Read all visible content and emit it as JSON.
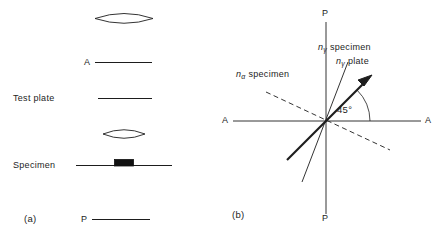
{
  "figure": {
    "background_color": "#ffffff",
    "stroke_color": "#1d1d1d",
    "width": 440,
    "height": 238
  },
  "panel_a": {
    "tag": "(a)",
    "labels": {
      "analyzer": "A",
      "test_plate": "Test plate",
      "specimen": "Specimen",
      "polarizer": "P"
    },
    "elements": [
      {
        "name": "top-lens",
        "kind": "lens"
      },
      {
        "name": "analyzer-line",
        "kind": "line"
      },
      {
        "name": "test-plate-line",
        "kind": "line"
      },
      {
        "name": "lower-lens",
        "kind": "lens"
      },
      {
        "name": "specimen-line",
        "kind": "line"
      },
      {
        "name": "specimen-block",
        "kind": "block"
      },
      {
        "name": "polarizer-line",
        "kind": "line"
      }
    ]
  },
  "panel_b": {
    "tag": "(b)",
    "axes": {
      "vertical_top": "P",
      "vertical_bottom": "P",
      "horizontal_left": "A",
      "horizontal_right": "A"
    },
    "annotations": {
      "n_gamma_specimen": {
        "symbol": "n",
        "subscript": "γ",
        "text": "specimen"
      },
      "n_gamma_plate": {
        "symbol": "n",
        "subscript": "γ",
        "text": "plate"
      },
      "n_alpha_specimen": {
        "symbol": "n",
        "subscript": "α",
        "text": "specimen"
      },
      "angle": "45°"
    },
    "vectors": [
      {
        "name": "n-gamma-plate-arrow",
        "style": "solid-bold-arrow",
        "angle_deg": 45
      },
      {
        "name": "n-gamma-specimen-line",
        "style": "solid-thin",
        "angle_deg": 62
      },
      {
        "name": "n-alpha-specimen-line",
        "style": "dashed-thin",
        "angle_deg": 152
      }
    ]
  }
}
